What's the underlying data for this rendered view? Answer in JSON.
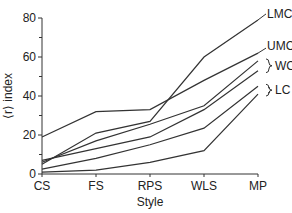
{
  "chart_data": {
    "type": "line",
    "title": "",
    "xlabel": "Style",
    "ylabel": "⟨r⟩ index",
    "categories": [
      "CS",
      "FS",
      "RPS",
      "WLS",
      "MP"
    ],
    "ylim": [
      0,
      80
    ],
    "yticks": [
      0,
      20,
      40,
      60,
      80
    ],
    "yminor_ticks": [
      10,
      30,
      50,
      70
    ],
    "grid": false,
    "legend": "direct labels at right end of lines",
    "series": [
      {
        "name": "LMC",
        "values": [
          5,
          21,
          27,
          60,
          79
        ]
      },
      {
        "name": "UMC",
        "values": [
          19,
          32,
          33,
          48,
          62
        ]
      },
      {
        "name": "WC (a)",
        "values": [
          6,
          17,
          25.5,
          35,
          58
        ]
      },
      {
        "name": "WC (b)",
        "values": [
          7,
          13,
          19,
          33,
          53
        ]
      },
      {
        "name": "LC (a)",
        "values": [
          2.5,
          8,
          15,
          23.5,
          45
        ]
      },
      {
        "name": "LC (b)",
        "values": [
          1,
          2,
          6,
          12,
          41
        ]
      }
    ],
    "annotations": [
      {
        "text": "LMC",
        "y": 79
      },
      {
        "text": "UMC",
        "y": 62
      },
      {
        "text": "WC",
        "bracket": [
          53,
          58
        ]
      },
      {
        "text": "LC",
        "bracket": [
          41,
          45
        ]
      }
    ],
    "line_color": "#333333"
  }
}
